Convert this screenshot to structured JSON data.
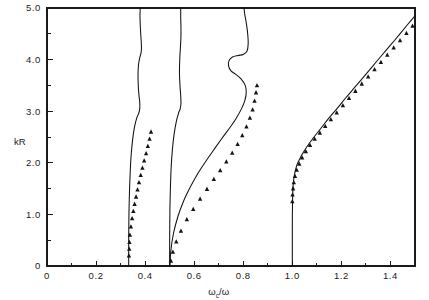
{
  "figure": {
    "background_color": "#ffffff",
    "line_color": "#111111",
    "marker_color": "#141414"
  },
  "chart_data": {
    "type": "line",
    "title": "",
    "subtitle": "",
    "xlabel": "ωc/ω",
    "xlabel_main": "ω",
    "xlabel_subscript": "c",
    "xlabel_tail": "/ω",
    "ylabel": "kR",
    "xlim": [
      0,
      1.5
    ],
    "ylim": [
      0,
      5.0
    ],
    "grid": false,
    "legend": "none",
    "xticks": [
      0,
      0.2,
      0.4,
      0.6,
      0.8,
      1.0,
      1.2,
      1.4
    ],
    "xtick_labels": [
      "0",
      "0.2",
      "0.4",
      "0.6",
      "0.8",
      "1.0",
      "1.2",
      "1.4"
    ],
    "xticks_minor": [
      0.1,
      0.3,
      0.5,
      0.7,
      0.9,
      1.1,
      1.3,
      1.5
    ],
    "yticks": [
      1.0,
      2.0,
      3.0,
      4.0,
      5.0
    ],
    "ytick_labels": [
      "1.0",
      "2.0",
      "3.0",
      "4.0",
      "5.0"
    ],
    "yticks_minor": [
      0.5,
      1.5,
      2.5,
      3.5,
      4.5
    ],
    "y_origin_label": "0",
    "series": [
      {
        "name": "branch-1",
        "type": "line",
        "asymptote_x": 0.333,
        "points": [
          [
            0.333,
            0.0
          ],
          [
            0.333,
            0.55
          ],
          [
            0.334,
            1.0
          ],
          [
            0.336,
            1.4
          ],
          [
            0.339,
            1.8
          ],
          [
            0.343,
            2.15
          ],
          [
            0.349,
            2.45
          ],
          [
            0.357,
            2.7
          ],
          [
            0.366,
            2.87
          ],
          [
            0.374,
            2.96
          ],
          [
            0.378,
            3.05
          ],
          [
            0.378,
            3.18
          ],
          [
            0.375,
            3.3
          ],
          [
            0.372,
            3.5
          ],
          [
            0.371,
            3.72
          ],
          [
            0.373,
            3.9
          ],
          [
            0.378,
            4.04
          ],
          [
            0.383,
            4.12
          ],
          [
            0.385,
            4.22
          ],
          [
            0.384,
            4.35
          ],
          [
            0.382,
            4.5
          ],
          [
            0.38,
            4.68
          ],
          [
            0.379,
            4.85
          ],
          [
            0.38,
            5.0
          ]
        ]
      },
      {
        "name": "branch-2",
        "type": "line",
        "asymptote_x": 0.5,
        "points": [
          [
            0.5,
            0.0
          ],
          [
            0.5,
            0.6
          ],
          [
            0.501,
            1.1
          ],
          [
            0.503,
            1.5
          ],
          [
            0.506,
            1.9
          ],
          [
            0.511,
            2.25
          ],
          [
            0.518,
            2.55
          ],
          [
            0.527,
            2.8
          ],
          [
            0.536,
            2.96
          ],
          [
            0.543,
            3.05
          ],
          [
            0.546,
            3.15
          ],
          [
            0.545,
            3.3
          ],
          [
            0.542,
            3.5
          ],
          [
            0.54,
            3.75
          ],
          [
            0.541,
            4.0
          ],
          [
            0.544,
            4.25
          ],
          [
            0.546,
            4.45
          ],
          [
            0.546,
            4.65
          ],
          [
            0.545,
            4.82
          ],
          [
            0.545,
            5.0
          ]
        ]
      },
      {
        "name": "branch-3",
        "type": "line",
        "asymptote_x": 0.5,
        "points": [
          [
            0.501,
            0.0
          ],
          [
            0.505,
            0.3
          ],
          [
            0.515,
            0.62
          ],
          [
            0.533,
            0.95
          ],
          [
            0.556,
            1.25
          ],
          [
            0.583,
            1.52
          ],
          [
            0.613,
            1.78
          ],
          [
            0.646,
            2.02
          ],
          [
            0.681,
            2.26
          ],
          [
            0.714,
            2.48
          ],
          [
            0.745,
            2.68
          ],
          [
            0.772,
            2.87
          ],
          [
            0.793,
            3.05
          ],
          [
            0.806,
            3.2
          ],
          [
            0.812,
            3.35
          ],
          [
            0.808,
            3.5
          ],
          [
            0.79,
            3.63
          ],
          [
            0.768,
            3.72
          ],
          [
            0.75,
            3.78
          ],
          [
            0.74,
            3.88
          ],
          [
            0.742,
            3.98
          ],
          [
            0.756,
            4.05
          ],
          [
            0.778,
            4.08
          ],
          [
            0.8,
            4.1
          ],
          [
            0.815,
            4.16
          ],
          [
            0.82,
            4.3
          ],
          [
            0.818,
            4.5
          ],
          [
            0.812,
            4.72
          ],
          [
            0.806,
            4.88
          ],
          [
            0.803,
            5.0
          ]
        ]
      },
      {
        "name": "branch-4",
        "type": "line",
        "asymptote_x": 1.0,
        "points": [
          [
            1.0,
            0.0
          ],
          [
            1.0,
            0.5
          ],
          [
            1.0,
            0.95
          ],
          [
            1.001,
            1.3
          ],
          [
            1.003,
            1.55
          ],
          [
            1.008,
            1.75
          ],
          [
            1.018,
            1.95
          ],
          [
            1.035,
            2.12
          ],
          [
            1.058,
            2.3
          ],
          [
            1.085,
            2.48
          ],
          [
            1.115,
            2.66
          ],
          [
            1.148,
            2.86
          ],
          [
            1.182,
            3.05
          ],
          [
            1.218,
            3.26
          ],
          [
            1.254,
            3.46
          ],
          [
            1.29,
            3.66
          ],
          [
            1.327,
            3.87
          ],
          [
            1.364,
            4.08
          ],
          [
            1.4,
            4.28
          ],
          [
            1.437,
            4.49
          ],
          [
            1.47,
            4.68
          ],
          [
            1.5,
            4.85
          ]
        ]
      }
    ],
    "markers": [
      {
        "name": "experimental-points-branch-1",
        "shape": "triangle",
        "points": [
          [
            0.334,
            0.2
          ],
          [
            0.335,
            0.33
          ],
          [
            0.336,
            0.46
          ],
          [
            0.338,
            0.6
          ],
          [
            0.342,
            0.76
          ],
          [
            0.347,
            0.92
          ],
          [
            0.352,
            1.06
          ],
          [
            0.357,
            1.2
          ],
          [
            0.363,
            1.34
          ],
          [
            0.369,
            1.48
          ],
          [
            0.375,
            1.62
          ],
          [
            0.382,
            1.76
          ],
          [
            0.389,
            1.9
          ],
          [
            0.396,
            2.04
          ],
          [
            0.404,
            2.18
          ],
          [
            0.411,
            2.32
          ],
          [
            0.418,
            2.46
          ],
          [
            0.424,
            2.6
          ]
        ]
      },
      {
        "name": "experimental-points-branch-3",
        "shape": "triangle",
        "points": [
          [
            0.505,
            0.1
          ],
          [
            0.513,
            0.27
          ],
          [
            0.527,
            0.47
          ],
          [
            0.546,
            0.68
          ],
          [
            0.57,
            0.9
          ],
          [
            0.596,
            1.1
          ],
          [
            0.624,
            1.3
          ],
          [
            0.652,
            1.49
          ],
          [
            0.68,
            1.68
          ],
          [
            0.706,
            1.85
          ],
          [
            0.731,
            2.02
          ],
          [
            0.755,
            2.19
          ],
          [
            0.777,
            2.36
          ],
          [
            0.796,
            2.53
          ],
          [
            0.813,
            2.7
          ],
          [
            0.827,
            2.87
          ],
          [
            0.838,
            3.03
          ],
          [
            0.846,
            3.2
          ],
          [
            0.852,
            3.36
          ],
          [
            0.856,
            3.5
          ]
        ]
      },
      {
        "name": "experimental-points-branch-4",
        "shape": "triangle",
        "points": [
          [
            1.0,
            1.25
          ],
          [
            1.001,
            1.38
          ],
          [
            1.003,
            1.5
          ],
          [
            1.006,
            1.62
          ],
          [
            1.011,
            1.74
          ],
          [
            1.018,
            1.86
          ],
          [
            1.028,
            1.98
          ],
          [
            1.04,
            2.1
          ],
          [
            1.055,
            2.22
          ],
          [
            1.072,
            2.34
          ],
          [
            1.091,
            2.46
          ],
          [
            1.112,
            2.58
          ],
          [
            1.134,
            2.71
          ],
          [
            1.157,
            2.84
          ],
          [
            1.181,
            2.97
          ],
          [
            1.206,
            3.11
          ],
          [
            1.231,
            3.25
          ],
          [
            1.257,
            3.39
          ],
          [
            1.283,
            3.53
          ],
          [
            1.309,
            3.67
          ],
          [
            1.335,
            3.81
          ],
          [
            1.361,
            3.95
          ],
          [
            1.387,
            4.09
          ],
          [
            1.413,
            4.23
          ],
          [
            1.439,
            4.37
          ],
          [
            1.465,
            4.51
          ],
          [
            1.49,
            4.65
          ]
        ]
      }
    ]
  }
}
